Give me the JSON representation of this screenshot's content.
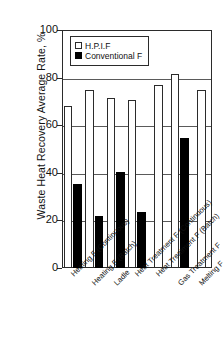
{
  "chart_data": {
    "type": "bar",
    "title": "",
    "subtitle": "",
    "xlabel": "",
    "ylabel": "Waste Heat Recovery Average Rate,  %",
    "ylim": [
      0,
      100
    ],
    "yticks": [
      0,
      20,
      40,
      60,
      80,
      100
    ],
    "grid": true,
    "legend_position": "top-center-inside",
    "categories": [
      "Heating F (Continuous)",
      "Heating F (Batch)",
      "Ladle",
      "Heat Treatment F (Continuous)",
      "Heat Treatment F (Batch)",
      "Gas Treatment F",
      "Melting F"
    ],
    "series": [
      {
        "name": "H.P.I.F",
        "color": "#ffffff",
        "edge_color": "#2b2b2b",
        "values": [
          68,
          75,
          71.5,
          70.5,
          77,
          81.5,
          75
        ]
      },
      {
        "name": "Conventional F",
        "color": "#000000",
        "edge_color": "#000000",
        "values": [
          35.5,
          22,
          40.5,
          23.5,
          null,
          54.5,
          null
        ]
      }
    ]
  },
  "axis": {
    "y_title": "Waste Heat Recovery Average Rate,  %",
    "y_tick_labels": [
      "100",
      "80",
      "60",
      "40",
      "20",
      "0"
    ]
  },
  "legend": {
    "entries": [
      {
        "label": "H.P.I.F",
        "marker": "open-square-marker"
      },
      {
        "label": "Conventional F",
        "marker": "filled-square-marker"
      }
    ]
  }
}
